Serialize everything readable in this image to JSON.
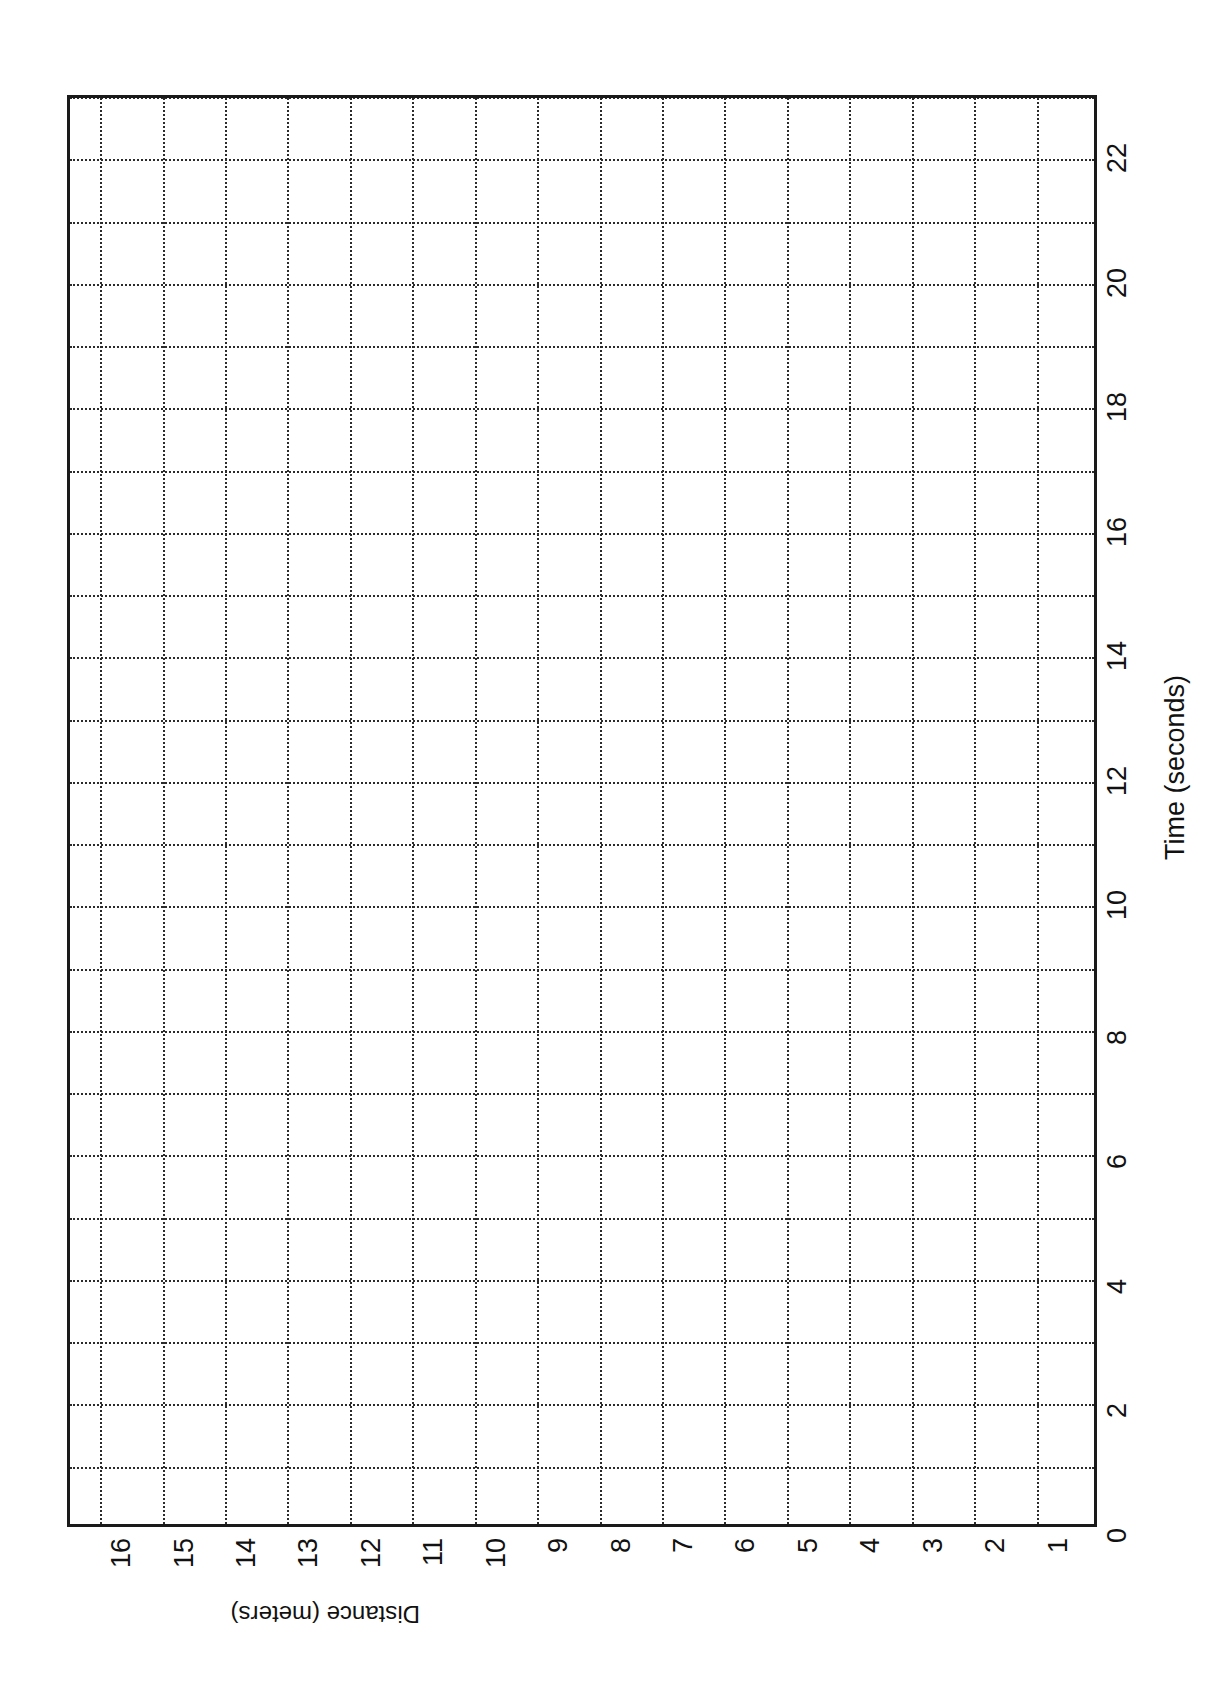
{
  "page": {
    "background": "#ffffff",
    "ink_color": "#1a1a1a",
    "rotation_note": "chart rotated 90 degrees clockwise on the page"
  },
  "chart_data": {
    "type": "line",
    "title": "",
    "subtitle": "",
    "xlabel": "Time (seconds)",
    "ylabel": "Distance (meters)",
    "xlim": [
      0,
      23
    ],
    "ylim": [
      0,
      16.5
    ],
    "x_tick_labels": [
      "0",
      "2",
      "4",
      "6",
      "8",
      "10",
      "12",
      "14",
      "16",
      "18",
      "20",
      "22"
    ],
    "x_tick_values": [
      0,
      2,
      4,
      6,
      8,
      10,
      12,
      14,
      16,
      18,
      20,
      22
    ],
    "y_tick_labels": [
      "1",
      "2",
      "3",
      "4",
      "5",
      "6",
      "7",
      "8",
      "9",
      "10",
      "11",
      "12",
      "13",
      "14",
      "15",
      "16"
    ],
    "y_tick_values": [
      1,
      2,
      3,
      4,
      5,
      6,
      7,
      8,
      9,
      10,
      11,
      12,
      13,
      14,
      15,
      16
    ],
    "x_gridline_values": [
      1,
      2,
      3,
      4,
      5,
      6,
      7,
      8,
      9,
      10,
      11,
      12,
      13,
      14,
      15,
      16,
      17,
      18,
      19,
      20,
      21,
      22,
      23
    ],
    "y_gridline_values": [
      1,
      2,
      3,
      4,
      5,
      6,
      7,
      8,
      9,
      10,
      11,
      12,
      13,
      14,
      15,
      16
    ],
    "grid": true,
    "grid_style": "dotted",
    "grid_color": "#2b2b2b",
    "legend": null,
    "series": [],
    "values": [],
    "annotations": [],
    "note": "empty grid — blank graph paper template, no plotted data points"
  },
  "axis_titles": {
    "time": "Time (seconds)",
    "distance": "Distance (meters)"
  }
}
